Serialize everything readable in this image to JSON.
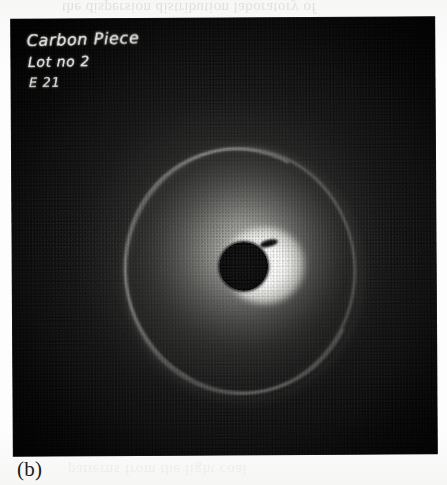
{
  "figure": {
    "label": "(b)",
    "kind": "photographic-diffraction-plate"
  },
  "photo": {
    "annotations": {
      "line1": "Carbon Piece",
      "line2": "Lot no 2",
      "line3": "E 21"
    },
    "features": {
      "beam_stop": "central opaque disc",
      "bright_lobe": "over-exposed halo right of beam stop",
      "diffraction_ring": "thin bright outer ring",
      "diffuse_halo": "broad diffuse scattering glow"
    },
    "colors": {
      "plate_background": "#101010",
      "annotation_ink": "#e6e6e0",
      "ring_highlight": "#d6d6d0",
      "lobe_peak": "#ffffff",
      "caption_text": "#1c1c1c",
      "page_background": "#fdfdfd"
    }
  },
  "scan_artifacts": {
    "bleed_top": "the dispersion distribution laboratory of",
    "bleed_bottom": "patterns from the light coal"
  }
}
